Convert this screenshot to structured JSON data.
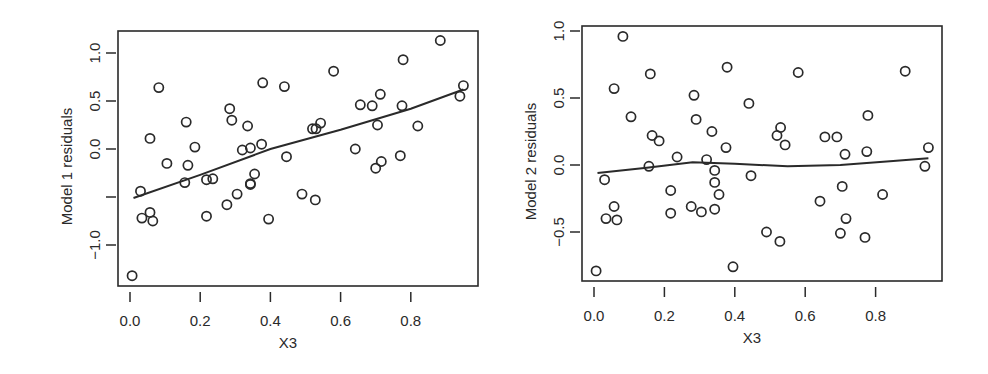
{
  "chart_data": [
    {
      "type": "scatter",
      "title": "",
      "xlabel": "X3",
      "ylabel": "Model 1 residuals",
      "xlim": [
        -0.03,
        0.97
      ],
      "ylim": [
        -1.43,
        1.22
      ],
      "xticks": [
        0.0,
        0.2,
        0.4,
        0.6,
        0.8
      ],
      "xtick_labels": [
        "0.0",
        "0.2",
        "0.4",
        "0.6",
        "0.8"
      ],
      "yticks": [
        -1.0,
        -0.5,
        0.0,
        0.5,
        1.0
      ],
      "ytick_labels": [
        "−1.0",
        "",
        "0.0",
        "0.5",
        "1.0"
      ],
      "grid": false,
      "legend": null,
      "smoother": {
        "name": "lowess fit",
        "x": [
          0.01,
          0.2,
          0.4,
          0.6,
          0.8,
          0.95
        ],
        "y": [
          -0.51,
          -0.27,
          0.0,
          0.2,
          0.42,
          0.62
        ]
      },
      "points": {
        "x": [
          0.082,
          0.16,
          0.057,
          0.378,
          0.284,
          0.44,
          0.105,
          0.29,
          0.335,
          0.165,
          0.185,
          0.375,
          0.236,
          0.32,
          0.156,
          0.343,
          0.343,
          0.446,
          0.03,
          0.355,
          0.218,
          0.057,
          0.034,
          0.065,
          0.218,
          0.276,
          0.305,
          0.343,
          0.49,
          0.006,
          0.395,
          0.58,
          0.884,
          0.778,
          0.53,
          0.52,
          0.543,
          0.656,
          0.69,
          0.713,
          0.775,
          0.95,
          0.94,
          0.705,
          0.642,
          0.82,
          0.716,
          0.7,
          0.77,
          0.528
        ],
        "y": [
          0.64,
          0.28,
          0.11,
          0.69,
          0.42,
          0.65,
          -0.15,
          0.3,
          0.24,
          -0.17,
          0.02,
          0.05,
          -0.31,
          -0.01,
          -0.35,
          0.01,
          -0.37,
          -0.08,
          -0.44,
          -0.26,
          -0.32,
          -0.66,
          -0.72,
          -0.75,
          -0.7,
          -0.58,
          -0.47,
          -0.36,
          -0.47,
          -1.32,
          -0.73,
          0.81,
          1.13,
          0.93,
          0.21,
          0.21,
          0.27,
          0.46,
          0.45,
          0.57,
          0.45,
          0.66,
          0.55,
          0.25,
          0.0,
          0.24,
          -0.13,
          -0.2,
          -0.07,
          -0.53
        ]
      }
    },
    {
      "type": "scatter",
      "title": "",
      "xlabel": "X3",
      "ylabel": "Model 2 residuals",
      "xlim": [
        -0.035,
        0.985
      ],
      "ylim": [
        -0.87,
        1.04
      ],
      "xticks": [
        0.0,
        0.2,
        0.4,
        0.6,
        0.8
      ],
      "xtick_labels": [
        "0.0",
        "0.2",
        "0.4",
        "0.6",
        "0.8"
      ],
      "yticks": [
        -0.5,
        0.0,
        0.5,
        1.0
      ],
      "ytick_labels": [
        "−0.5",
        "0.0",
        "0.5",
        "1.0"
      ],
      "grid": false,
      "legend": null,
      "smoother": {
        "name": "lowess fit",
        "x": [
          0.01,
          0.15,
          0.28,
          0.4,
          0.55,
          0.7,
          0.85,
          0.95
        ],
        "y": [
          -0.06,
          -0.02,
          0.02,
          0.01,
          -0.01,
          0.0,
          0.03,
          0.05
        ]
      },
      "points": {
        "x": [
          0.082,
          0.16,
          0.057,
          0.378,
          0.284,
          0.44,
          0.105,
          0.29,
          0.335,
          0.165,
          0.185,
          0.375,
          0.236,
          0.32,
          0.156,
          0.343,
          0.343,
          0.446,
          0.03,
          0.355,
          0.218,
          0.057,
          0.034,
          0.065,
          0.218,
          0.276,
          0.305,
          0.343,
          0.49,
          0.006,
          0.395,
          0.58,
          0.884,
          0.778,
          0.53,
          0.52,
          0.543,
          0.656,
          0.69,
          0.713,
          0.775,
          0.95,
          0.94,
          0.705,
          0.642,
          0.82,
          0.716,
          0.7,
          0.77,
          0.528
        ],
        "y": [
          0.96,
          0.68,
          0.57,
          0.73,
          0.52,
          0.46,
          0.36,
          0.34,
          0.25,
          0.22,
          0.18,
          0.13,
          0.06,
          0.04,
          -0.01,
          -0.04,
          -0.13,
          -0.08,
          -0.11,
          -0.22,
          -0.19,
          -0.31,
          -0.4,
          -0.41,
          -0.36,
          -0.31,
          -0.35,
          -0.33,
          -0.5,
          -0.79,
          -0.76,
          0.69,
          0.7,
          0.37,
          0.28,
          0.22,
          0.15,
          0.21,
          0.21,
          0.08,
          0.1,
          0.13,
          -0.01,
          -0.16,
          -0.27,
          -0.22,
          -0.4,
          -0.51,
          -0.54,
          -0.57
        ]
      }
    }
  ],
  "panels": [
    {
      "ylabel": "Model 1 residuals",
      "xlabel": "X3",
      "xtick_labels": [
        "0.0",
        "0.2",
        "0.4",
        "0.6",
        "0.8"
      ],
      "ytick_labels": [
        "−1.0",
        "0.0",
        "0.5",
        "1.0"
      ]
    },
    {
      "ylabel": "Model 2 residuals",
      "xlabel": "X3",
      "xtick_labels": [
        "0.0",
        "0.2",
        "0.4",
        "0.6",
        "0.8"
      ],
      "ytick_labels": [
        "−0.5",
        "0.0",
        "0.5",
        "1.0"
      ]
    }
  ],
  "style": {
    "ink_color": "#2a2a2a",
    "background": "#ffffff"
  }
}
